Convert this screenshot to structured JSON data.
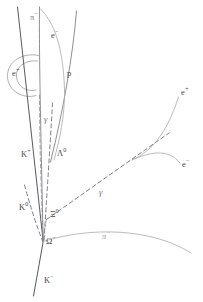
{
  "figure": {
    "kind": "bubble-chamber-event-diagram",
    "background_color": "#ffffff",
    "width": 203,
    "height": 302
  },
  "colors": {
    "track_solid": "#7b7b80",
    "track_dark": "#58585e",
    "track_faint": "#a9a9ae",
    "track_dashed": "#6f6f75",
    "label_text": "#4a4a50"
  },
  "labels": {
    "pi_minus_top": {
      "base": "π",
      "sup": "−",
      "x": 30,
      "y": 18
    },
    "e_minus_top": {
      "base": "e",
      "sup": "−",
      "x": 51,
      "y": 36
    },
    "e_plus_spiral": {
      "base": "e",
      "sup": "+",
      "x": 12,
      "y": 74
    },
    "proton": {
      "base": "p",
      "sup": "",
      "x": 68,
      "y": 74
    },
    "gamma_upper": {
      "base": "γ",
      "sup": "",
      "x": 44,
      "y": 120
    },
    "k_plus": {
      "base": "K",
      "sup": "+",
      "x": 22,
      "y": 155
    },
    "lambda_zero": {
      "base": "Λ",
      "sup": "0",
      "x": 57,
      "y": 154
    },
    "e_plus_right": {
      "base": "e",
      "sup": "+",
      "x": 183,
      "y": 93
    },
    "e_minus_right": {
      "base": "e",
      "sup": "−",
      "x": 184,
      "y": 165
    },
    "gamma_right": {
      "base": "γ",
      "sup": "",
      "x": 99,
      "y": 193
    },
    "k_zero": {
      "base": "K",
      "sup": "0",
      "x": 20,
      "y": 208
    },
    "xi_zero": {
      "base": "Ξ",
      "sup": "0",
      "x": 50,
      "y": 215
    },
    "omega_minus": {
      "base": "Ω",
      "sup": "−",
      "x": 46,
      "y": 242
    },
    "pi_minus_bottom": {
      "base": "π",
      "sup": "−",
      "x": 103,
      "y": 236
    },
    "k_minus": {
      "base": "K",
      "sup": "−",
      "x": 44,
      "y": 281
    }
  },
  "tracks": [
    {
      "name": "k-minus-incoming",
      "style": "solid-dark",
      "d": "M 18 8 L 43 242"
    },
    {
      "name": "k-minus-outgoing",
      "style": "solid-dark",
      "d": "M 43 242 L 33 295"
    },
    {
      "name": "beam-vertical-left",
      "style": "solid",
      "d": "M 40 8 C 40 60 41 120 43 242"
    },
    {
      "name": "proton-track",
      "style": "solid",
      "d": "M 76 12 C 72 60 62 110 50 160"
    },
    {
      "name": "e-minus-curl-top",
      "style": "faint",
      "d": "M 41 10 C 52 22 62 44 64 90 C 65 118 60 140 55 158"
    },
    {
      "name": "k-plus-dashed",
      "style": "dashed-fine",
      "d": "M 40 96 C 40 140 41 190 43 240"
    },
    {
      "name": "lambda-dashed",
      "style": "dashed",
      "d": "M 52 104 C 50 140 47 190 44 240"
    },
    {
      "name": "xi-zero-dashed",
      "style": "dashed-fine",
      "d": "M 44 240 C 44 232 45 226 46 220"
    },
    {
      "name": "k-zero-dashed",
      "style": "dashed",
      "d": "M 25 186 C 30 206 36 226 43 242"
    },
    {
      "name": "gamma-right-dashed",
      "style": "dashed",
      "d": "M 46 220 L 170 133"
    },
    {
      "name": "e-plus-right-curve",
      "style": "faint",
      "d": "M 60 196 C 110 178 150 160 178 98"
    },
    {
      "name": "e-minus-right-curve",
      "style": "faint",
      "d": "M 60 196 C 110 178 150 152 178 162"
    },
    {
      "name": "pi-minus-bottom-curve",
      "style": "faint",
      "d": "M 43 242 C 90 228 150 229 190 254"
    },
    {
      "name": "spiral-circle",
      "style": "spiral",
      "d": "M 37 57 C 20 55 8 64 9 77 C 10 90 22 98 34 95"
    },
    {
      "name": "spiral-inner",
      "style": "spiral",
      "d": "M 36 62 C 24 61 16 68 17 77 C 18 86 27 91 35 89"
    }
  ]
}
